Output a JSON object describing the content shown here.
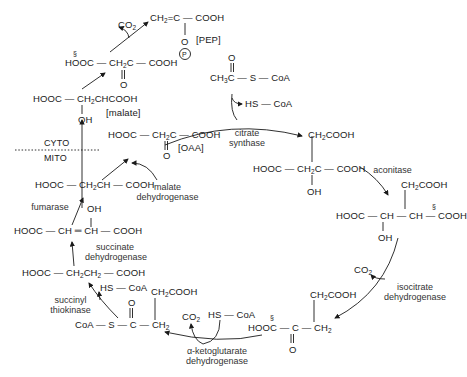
{
  "diagram": {
    "compartments": {
      "cyto": "CYTO",
      "mito": "MITO"
    },
    "compounds": {
      "pep": {
        "label": "[PEP]",
        "formula_a": "CH",
        "formula_b": "=C — COOH",
        "o": "O",
        "p": "P"
      },
      "co2_top": "CO",
      "oxaloacetate_cyto": {
        "left": "HOOC — CH",
        "right": "C — COOH",
        "o": "O",
        "section": "§"
      },
      "malate_cyto": {
        "formula": "HOOC — CH",
        "formula_b": "CHCOOH",
        "oh": "OH",
        "label": "[malate]"
      },
      "acetyl_coa": {
        "o": "O",
        "formula": "CH",
        "formula_b": "C — S — CoA"
      },
      "hs_coa_1": "HS — CoA",
      "oaa": {
        "left": "HOOC — CH",
        "right": "C — COOH",
        "o": "O",
        "label": "[OAA]"
      },
      "citrate": {
        "top": "CH",
        "top_b": "COOH",
        "main": "HOOC — CH",
        "main_b": "C — COOH",
        "oh": "OH"
      },
      "isocitrate": {
        "top": "CH",
        "top_b": "COOH",
        "main": "HOOC — CH — CH — COOH",
        "oh": "OH",
        "section": "§"
      },
      "co2_iso": "CO",
      "alpha_kg": {
        "top": "CH",
        "top_b": "COOH",
        "main": "HOOC — C — CH",
        "o": "O",
        "section": "§"
      },
      "co2_akg": "CO",
      "hs_coa_2": "HS — CoA",
      "succinyl_coa": {
        "o": "O",
        "top": "CH",
        "top_b": "COOH",
        "main": "CoA — S — C — CH"
      },
      "hs_coa_3": "HS — CoA",
      "succinate": {
        "main": "HOOC — CH",
        "mid": "CH",
        "end": " — COOH"
      },
      "fumarate": {
        "main": "HOOC — CH ═ CH — COOH"
      },
      "malate_mito": {
        "main": "HOOC — CH",
        "main_b": "CH — COOH",
        "oh": "OH"
      }
    },
    "enzymes": {
      "citrate_synthase": [
        "citrate",
        "synthase"
      ],
      "aconitase": "aconitase",
      "isocitrate_dh": [
        "isocitrate",
        "dehydrogenase"
      ],
      "akg_dh": [
        "α-ketoglutarate",
        "dehydrogenase"
      ],
      "succinyl_thiokinase": [
        "succinyl",
        "thiokinase"
      ],
      "succinate_dh": [
        "succinate",
        "dehydrogenase"
      ],
      "fumarase": "fumarase",
      "malate_dh": [
        "malate",
        "dehydrogenase"
      ]
    },
    "subscripts": {
      "two": "2",
      "three": "3"
    },
    "section_mark": "§"
  }
}
